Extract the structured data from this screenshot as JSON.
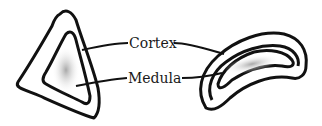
{
  "diagram": {
    "labels": {
      "cortex": "Cortex",
      "medula": "Medula"
    },
    "colors": {
      "outline": "#111111",
      "medulla_fill": "#bdbdbd",
      "background": "#ffffff"
    }
  }
}
